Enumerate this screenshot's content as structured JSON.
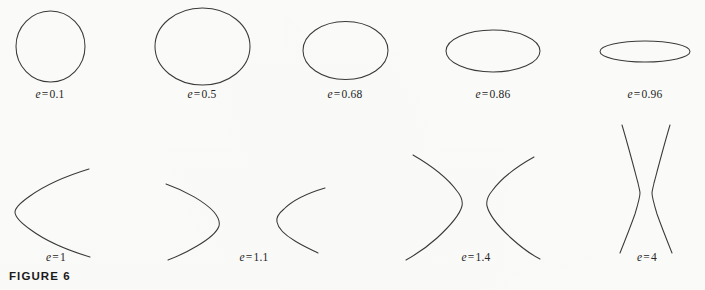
{
  "figure": {
    "number_label": "FIGURE 6",
    "background_color": "#fcfcfa",
    "stroke_color": "#3a3a38",
    "text_color": "#262626"
  },
  "variable_symbol": "e",
  "equals_symbol": "=",
  "rows": [
    {
      "name": "ellipses-row",
      "shapes": [
        {
          "id": "ellipse-e-0-1",
          "kind": "ellipse",
          "eccentricity": "0.1",
          "label_value": "0.1",
          "cx": 50.5,
          "cy": 46.5,
          "rx": 34.5,
          "ry": 35.5,
          "label_x": 50,
          "label_y": 88
        },
        {
          "id": "ellipse-e-0-5",
          "kind": "ellipse",
          "eccentricity": "0.5",
          "label_value": "0.5",
          "cx": 202.5,
          "cy": 46.5,
          "rx": 47.5,
          "ry": 38.5,
          "label_x": 202,
          "label_y": 88
        },
        {
          "id": "ellipse-e-0-68",
          "kind": "ellipse",
          "eccentricity": "0.68",
          "label_value": "0.68",
          "cx": 345.5,
          "cy": 50.5,
          "rx": 42.5,
          "ry": 29.0,
          "label_x": 345,
          "label_y": 88
        },
        {
          "id": "ellipse-e-0-86",
          "kind": "ellipse",
          "eccentricity": "0.86",
          "label_value": "0.86",
          "cx": 493.0,
          "cy": 51.0,
          "rx": 47.0,
          "ry": 21.0,
          "label_x": 493,
          "label_y": 88
        },
        {
          "id": "ellipse-e-0-96",
          "kind": "ellipse",
          "eccentricity": "0.96",
          "label_value": "0.96",
          "cx": 645.0,
          "cy": 51.5,
          "rx": 45.0,
          "ry": 10.5,
          "label_x": 645,
          "label_y": 88
        }
      ]
    },
    {
      "name": "parabola-hyperbola-row",
      "shapes": [
        {
          "id": "parabola-e-1",
          "kind": "parabola",
          "eccentricity": "1",
          "label_value": "1",
          "label_x": 56,
          "label_y": 251
        },
        {
          "id": "hyperbola-e-1-1",
          "kind": "hyperbola",
          "eccentricity": "1.1",
          "label_value": "1.1",
          "label_x": 254,
          "label_y": 251
        },
        {
          "id": "hyperbola-e-1-4",
          "kind": "hyperbola",
          "eccentricity": "1.4",
          "label_value": "1.4",
          "label_x": 476,
          "label_y": 251
        },
        {
          "id": "hyperbola-e-4",
          "kind": "hyperbola",
          "eccentricity": "4",
          "label_value": "4",
          "label_x": 647,
          "label_y": 251
        }
      ]
    }
  ]
}
